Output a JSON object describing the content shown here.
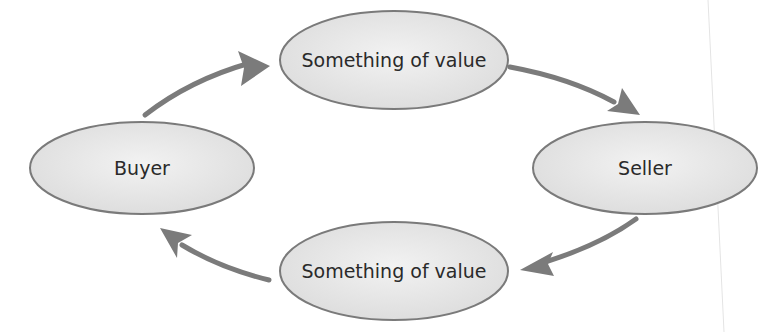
{
  "diagram": {
    "type": "exchange-cycle",
    "nodes": [
      {
        "id": "top",
        "label": "Something of value",
        "cx": 394,
        "cy": 60,
        "rx": 114,
        "ry": 49
      },
      {
        "id": "buyer",
        "label": "Buyer",
        "cx": 142,
        "cy": 168,
        "rx": 112,
        "ry": 46
      },
      {
        "id": "seller",
        "label": "Seller",
        "cx": 645,
        "cy": 168,
        "rx": 112,
        "ry": 46
      },
      {
        "id": "bottom",
        "label": "Something of value",
        "cx": 394,
        "cy": 271,
        "rx": 114,
        "ry": 49
      }
    ],
    "edges": [
      {
        "from": "buyer",
        "to": "top"
      },
      {
        "from": "top",
        "to": "seller"
      },
      {
        "from": "seller",
        "to": "bottom"
      },
      {
        "from": "bottom",
        "to": "buyer"
      }
    ],
    "colors": {
      "node_fill": "#e6e6e6",
      "node_stroke": "#7a7a7a",
      "arrow": "#7b7b7b",
      "text": "#2a2a2a",
      "guide_line": "#e4e4e4"
    }
  }
}
